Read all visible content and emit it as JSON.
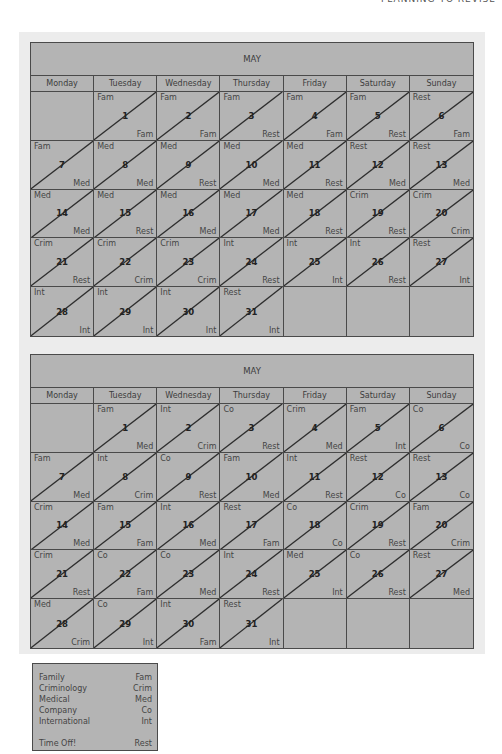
{
  "running_head": "PLANNING TO REVISE",
  "weekdays": [
    "Monday",
    "Tuesday",
    "Wednesday",
    "Thursday",
    "Friday",
    "Saturday",
    "Sunday"
  ],
  "calendars": [
    {
      "title": "MAY",
      "cells": [
        {
          "day": "",
          "am": "",
          "pm": ""
        },
        {
          "day": "1",
          "am": "Fam",
          "pm": "Fam"
        },
        {
          "day": "2",
          "am": "Fam",
          "pm": "Fam"
        },
        {
          "day": "3",
          "am": "Fam",
          "pm": "Rest"
        },
        {
          "day": "4",
          "am": "Fam",
          "pm": "Fam"
        },
        {
          "day": "5",
          "am": "Fam",
          "pm": "Rest"
        },
        {
          "day": "6",
          "am": "Rest",
          "pm": "Fam"
        },
        {
          "day": "7",
          "am": "Fam",
          "pm": "Med"
        },
        {
          "day": "8",
          "am": "Med",
          "pm": "Med"
        },
        {
          "day": "9",
          "am": "Med",
          "pm": "Rest"
        },
        {
          "day": "10",
          "am": "Med",
          "pm": "Med"
        },
        {
          "day": "11",
          "am": "Med",
          "pm": "Rest"
        },
        {
          "day": "12",
          "am": "Rest",
          "pm": "Med"
        },
        {
          "day": "13",
          "am": "Rest",
          "pm": "Med"
        },
        {
          "day": "14",
          "am": "Med",
          "pm": "Med"
        },
        {
          "day": "15",
          "am": "Med",
          "pm": "Rest"
        },
        {
          "day": "16",
          "am": "Med",
          "pm": "Med"
        },
        {
          "day": "17",
          "am": "Med",
          "pm": "Med"
        },
        {
          "day": "18",
          "am": "Med",
          "pm": "Rest"
        },
        {
          "day": "19",
          "am": "Crim",
          "pm": "Rest"
        },
        {
          "day": "20",
          "am": "Crim",
          "pm": "Crim"
        },
        {
          "day": "21",
          "am": "Crim",
          "pm": "Rest"
        },
        {
          "day": "22",
          "am": "Crim",
          "pm": "Crim"
        },
        {
          "day": "23",
          "am": "Crim",
          "pm": "Crim"
        },
        {
          "day": "24",
          "am": "Int",
          "pm": "Rest"
        },
        {
          "day": "25",
          "am": "Int",
          "pm": "Int"
        },
        {
          "day": "26",
          "am": "Int",
          "pm": "Rest"
        },
        {
          "day": "27",
          "am": "Rest",
          "pm": "Int"
        },
        {
          "day": "28",
          "am": "Int",
          "pm": "Int"
        },
        {
          "day": "29",
          "am": "Int",
          "pm": "Int"
        },
        {
          "day": "30",
          "am": "Int",
          "pm": "Int"
        },
        {
          "day": "31",
          "am": "Rest",
          "pm": "Int"
        },
        {
          "day": "",
          "am": "",
          "pm": ""
        },
        {
          "day": "",
          "am": "",
          "pm": ""
        },
        {
          "day": "",
          "am": "",
          "pm": ""
        }
      ]
    },
    {
      "title": "MAY",
      "cells": [
        {
          "day": "",
          "am": "",
          "pm": ""
        },
        {
          "day": "1",
          "am": "Fam",
          "pm": "Med"
        },
        {
          "day": "2",
          "am": "Int",
          "pm": "Crim"
        },
        {
          "day": "3",
          "am": "Co",
          "pm": "Rest"
        },
        {
          "day": "4",
          "am": "Crim",
          "pm": "Med"
        },
        {
          "day": "5",
          "am": "Fam",
          "pm": "Int"
        },
        {
          "day": "6",
          "am": "Co",
          "pm": "Co"
        },
        {
          "day": "7",
          "am": "Fam",
          "pm": "Med"
        },
        {
          "day": "8",
          "am": "Int",
          "pm": "Crim"
        },
        {
          "day": "9",
          "am": "Co",
          "pm": "Rest"
        },
        {
          "day": "10",
          "am": "Fam",
          "pm": "Med"
        },
        {
          "day": "11",
          "am": "Int",
          "pm": "Rest"
        },
        {
          "day": "12",
          "am": "Rest",
          "pm": "Co"
        },
        {
          "day": "13",
          "am": "Rest",
          "pm": "Co"
        },
        {
          "day": "14",
          "am": "Crim",
          "pm": "Med"
        },
        {
          "day": "15",
          "am": "Fam",
          "pm": "Fam"
        },
        {
          "day": "16",
          "am": "Int",
          "pm": "Med"
        },
        {
          "day": "17",
          "am": "Rest",
          "pm": "Fam"
        },
        {
          "day": "18",
          "am": "Co",
          "pm": "Co"
        },
        {
          "day": "19",
          "am": "Crim",
          "pm": "Rest"
        },
        {
          "day": "20",
          "am": "Fam",
          "pm": "Crim"
        },
        {
          "day": "21",
          "am": "Crim",
          "pm": "Rest"
        },
        {
          "day": "22",
          "am": "Co",
          "pm": "Fam"
        },
        {
          "day": "23",
          "am": "Co",
          "pm": "Med"
        },
        {
          "day": "24",
          "am": "Int",
          "pm": "Rest"
        },
        {
          "day": "25",
          "am": "Med",
          "pm": "Int"
        },
        {
          "day": "26",
          "am": "Co",
          "pm": "Rest"
        },
        {
          "day": "27",
          "am": "Rest",
          "pm": "Med"
        },
        {
          "day": "28",
          "am": "Med",
          "pm": "Crim"
        },
        {
          "day": "29",
          "am": "Co",
          "pm": "Int"
        },
        {
          "day": "30",
          "am": "Int",
          "pm": "Fam"
        },
        {
          "day": "31",
          "am": "Rest",
          "pm": "Int"
        },
        {
          "day": "",
          "am": "",
          "pm": ""
        },
        {
          "day": "",
          "am": "",
          "pm": ""
        },
        {
          "day": "",
          "am": "",
          "pm": ""
        }
      ]
    }
  ],
  "legend": [
    {
      "label": "Family",
      "code": "Fam"
    },
    {
      "label": "Criminology",
      "code": "Crim"
    },
    {
      "label": "Medical",
      "code": "Med"
    },
    {
      "label": "Company",
      "code": "Co"
    },
    {
      "label": "International",
      "code": "Int"
    },
    {
      "label": "Time Off!",
      "code": "Rest"
    }
  ],
  "colors": {
    "cell_fill": "#b4b4b4",
    "grid_line": "#4a4a4a",
    "panel_bg": "#ececec"
  }
}
